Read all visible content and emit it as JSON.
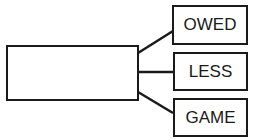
{
  "diagram": {
    "source_box": {
      "label": ""
    },
    "targets": [
      {
        "label": "OWED"
      },
      {
        "label": "LESS"
      },
      {
        "label": "GAME"
      }
    ],
    "colors": {
      "stroke": "#1a1a1a",
      "background": "#ffffff"
    }
  }
}
